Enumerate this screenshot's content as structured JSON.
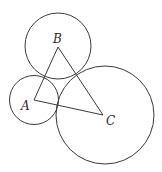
{
  "diagram": {
    "stroke_color": "#3a3a3a",
    "label_color": "#2a2a2a",
    "circles": [
      {
        "name": "circle-a",
        "cx": 34,
        "cy": 100,
        "r": 24.5
      },
      {
        "name": "circle-b",
        "cx": 58,
        "cy": 46,
        "r": 33
      },
      {
        "name": "circle-c",
        "cx": 105,
        "cy": 115,
        "r": 49
      }
    ],
    "triangle": {
      "points": "34,100 58,47 103,115"
    },
    "labels": {
      "a": {
        "text": "A",
        "x": 21,
        "y": 110
      },
      "b": {
        "text": "B",
        "x": 53,
        "y": 43
      },
      "c": {
        "text": "C",
        "x": 106,
        "y": 125
      }
    }
  }
}
